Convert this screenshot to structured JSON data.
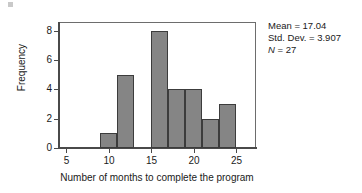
{
  "chart_data": {
    "type": "bar",
    "title": "",
    "subtitle": "",
    "xlabel": "Number of months to complete the program",
    "ylabel": "Frequency",
    "xlim": [
      4,
      27.3
    ],
    "ylim": [
      0,
      8.6
    ],
    "xticks": [
      5,
      10,
      15,
      20,
      25
    ],
    "xtick_labels": [
      "5",
      "10",
      "15",
      "20",
      "25"
    ],
    "yticks": [
      0,
      2,
      4,
      6,
      8
    ],
    "ytick_labels": [
      "0",
      "2",
      "4",
      "6",
      "8"
    ],
    "grid": false,
    "legend": null,
    "bin_width": 2,
    "categories": [
      "9-11",
      "11-13",
      "15-17",
      "17-19",
      "19-21",
      "21-23",
      "23-25"
    ],
    "bins": [
      {
        "start": 9,
        "end": 11,
        "value": 1
      },
      {
        "start": 11,
        "end": 13,
        "value": 5
      },
      {
        "start": 15,
        "end": 17,
        "value": 8
      },
      {
        "start": 17,
        "end": 19,
        "value": 4
      },
      {
        "start": 19,
        "end": 21,
        "value": 4
      },
      {
        "start": 21,
        "end": 23,
        "value": 2
      },
      {
        "start": 23,
        "end": 25,
        "value": 3
      }
    ],
    "values": [
      1,
      5,
      8,
      4,
      4,
      2,
      3
    ],
    "bar_fill_color": "#858585",
    "bar_edge_color": "#3c3c3c",
    "axis_color": "#4a4a4a"
  },
  "annotations": {
    "mean_label": "Mean = 17.04",
    "stddev_label": "Std. Dev. = 3.907",
    "n_label": "N = 27",
    "n_symbol": "N",
    "n_value": "= 27"
  }
}
